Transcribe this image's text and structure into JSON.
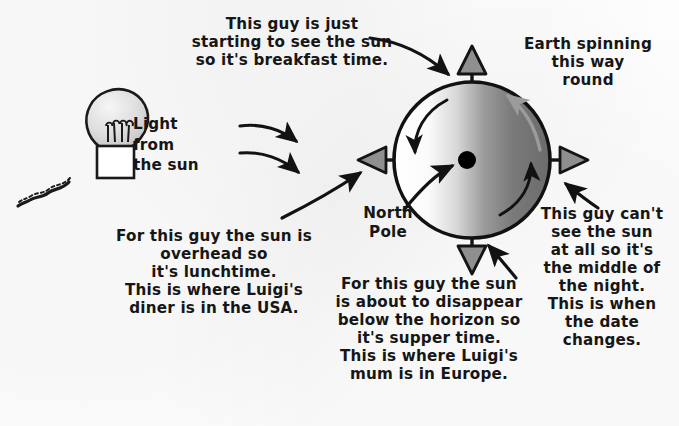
{
  "diagram": {
    "background_color": "#fdfdfd",
    "ink_color": "#161616",
    "accent_grey": "#8a8a8a"
  },
  "labels": {
    "breakfast": "This guy is just\nstarting to see the sun\nso it's breakfast time.",
    "earth_spinning": "Earth spinning\nthis way\nround",
    "light_from_sun": "Light\nfrom\nthe sun",
    "north_pole": "North\nPole",
    "lunchtime": "For this guy the sun is\noverhead so\nit's lunchtime.\nThis is where Luigi's\ndiner is in the USA.",
    "supper": "For this guy the sun\nis about to disappear\nbelow the horizon so\nit's supper time.\nThis is where Luigi's\nmum is in Europe.",
    "night": "This guy can't\nsee the sun\nat all so it's\nthe middle of\nthe night.\nThis is when\nthe date\nchanges."
  },
  "figures": {
    "lightbulb": {
      "name": "light-bulb",
      "bulb_fill_light": "#f2f2f2",
      "bulb_fill_dark": "#b9b9b9",
      "base_fill": "#ffffff",
      "outline": "#1a1a1a"
    },
    "earth": {
      "name": "earth-globe",
      "center_x": 472,
      "center_y": 160,
      "radius": 78,
      "day_side_fill": "#ffffff",
      "terminator_fill": "#b0b0b0",
      "night_side_fill": "#6e6e6e",
      "outline": "#111111",
      "pole_dot_fill": "#000000",
      "spin_direction": "anticlockwise"
    },
    "position_markers": [
      {
        "name": "marker-north-top",
        "direction": "up",
        "fill": "#8f8f8f",
        "meaning": "North Pole axis"
      },
      {
        "name": "marker-dawn-left",
        "direction": "left",
        "fill": "#8f8f8f",
        "meaning": "breakfast / sunrise"
      },
      {
        "name": "marker-dusk-right",
        "direction": "right",
        "fill": "#8f8f8f",
        "meaning": "night side"
      },
      {
        "name": "marker-noon-down",
        "direction": "down",
        "fill": "#8f8f8f",
        "meaning": "supper / sunset"
      }
    ],
    "sun_rays": [
      {
        "name": "sun-ray-upper"
      },
      {
        "name": "sun-ray-lower"
      }
    ]
  }
}
